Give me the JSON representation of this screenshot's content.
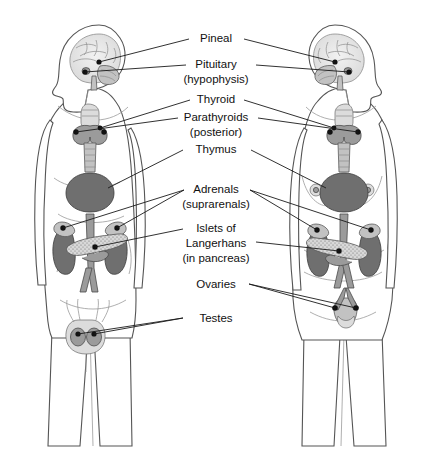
{
  "diagram": {
    "background": "#ffffff",
    "line_color": "#1a1a1a",
    "text_color": "#111111"
  },
  "labels": [
    {
      "id": "pineal",
      "text": "Pineal",
      "text2": "",
      "x": 216,
      "y": 42
    },
    {
      "id": "pituitary",
      "text": "Pituitary",
      "text2": "(hypophysis)",
      "x": 216,
      "y": 68
    },
    {
      "id": "thyroid",
      "text": "Thyroid",
      "text2": "",
      "x": 216,
      "y": 103
    },
    {
      "id": "parathyroids",
      "text": "Parathyroids",
      "text2": "(posterior)",
      "x": 216,
      "y": 121
    },
    {
      "id": "thymus",
      "text": "Thymus",
      "text2": "",
      "x": 216,
      "y": 153
    },
    {
      "id": "adrenals",
      "text": "Adrenals",
      "text2": "(suprarenals)",
      "x": 216,
      "y": 192
    },
    {
      "id": "islets",
      "text": "Islets of",
      "text2": "Langerhans",
      "text3": "(in pancreas)",
      "x": 216,
      "y": 232
    },
    {
      "id": "ovaries",
      "text": "Ovaries",
      "text2": "",
      "x": 216,
      "y": 287
    },
    {
      "id": "testes",
      "text": "Testes",
      "text2": "",
      "x": 216,
      "y": 321
    }
  ],
  "figures": [
    {
      "id": "male",
      "name": "male-figure",
      "facing": "left"
    },
    {
      "id": "female",
      "name": "female-figure",
      "facing": "right"
    }
  ],
  "organs": [
    {
      "id": "brain",
      "label": "brain"
    },
    {
      "id": "pineal",
      "label": "pineal gland"
    },
    {
      "id": "pituitary",
      "label": "pituitary gland"
    },
    {
      "id": "larynx",
      "label": "larynx"
    },
    {
      "id": "thyroid",
      "label": "thyroid gland"
    },
    {
      "id": "parathyroid",
      "label": "parathyroid glands"
    },
    {
      "id": "trachea",
      "label": "trachea"
    },
    {
      "id": "thymus",
      "label": "thymus"
    },
    {
      "id": "adrenal",
      "label": "adrenal glands"
    },
    {
      "id": "kidney",
      "label": "kidneys"
    },
    {
      "id": "pancreas",
      "label": "pancreas"
    },
    {
      "id": "aorta",
      "label": "aorta"
    },
    {
      "id": "uterus",
      "label": "uterus"
    },
    {
      "id": "ovary",
      "label": "ovaries"
    },
    {
      "id": "testis",
      "label": "testes"
    },
    {
      "id": "breast",
      "label": "breasts"
    }
  ]
}
